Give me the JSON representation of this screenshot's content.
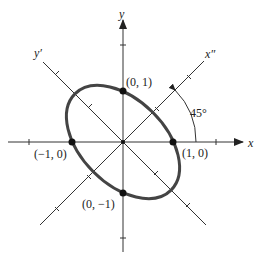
{
  "diagram": {
    "type": "rotated-ellipse",
    "rotation_degrees": 45,
    "axes": {
      "x_label": "x",
      "y_label": "y",
      "x_rotated_label": "x″",
      "y_rotated_label": "y′"
    },
    "points": [
      {
        "label": "(0, 1)",
        "x": 0,
        "y": 1
      },
      {
        "label": "(−1, 0)",
        "x": -1,
        "y": 0
      },
      {
        "label": "(1, 0)",
        "x": 1,
        "y": 0
      },
      {
        "label": "(0, −1)",
        "x": 0,
        "y": -1
      }
    ],
    "angle_label": "45°",
    "colors": {
      "ellipse": "#444444",
      "axes": "#333333",
      "points": "#111111"
    }
  }
}
